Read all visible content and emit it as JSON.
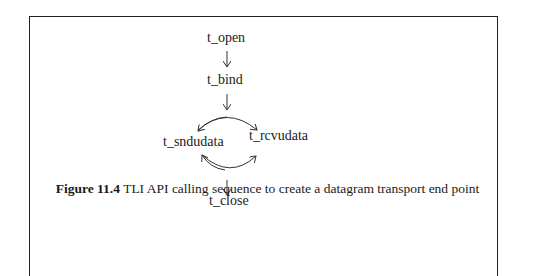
{
  "diagram": {
    "nodes": [
      {
        "id": "open",
        "label": "t_open"
      },
      {
        "id": "bind",
        "label": "t_bind"
      },
      {
        "id": "snd",
        "label": "t_sndudata"
      },
      {
        "id": "rcv",
        "label": "t_rcvudata"
      },
      {
        "id": "close",
        "label": "t_close"
      }
    ],
    "edges": [
      {
        "from": "t_open",
        "to": "t_bind"
      },
      {
        "from": "t_bind",
        "to": "t_sndudata/t_rcvudata"
      },
      {
        "from": "t_sndudata",
        "to": "t_rcvudata"
      },
      {
        "from": "t_rcvudata",
        "to": "t_sndudata"
      },
      {
        "from": "t_sndudata/t_rcvudata",
        "to": "t_close"
      }
    ]
  },
  "caption": {
    "number": "Figure 11.4",
    "text": " TLI API calling sequence to create a datagram transport end point"
  }
}
